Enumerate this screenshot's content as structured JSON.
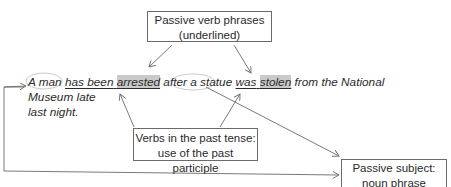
{
  "diagram": {
    "boxes": {
      "top": {
        "line1": "Passive verb phrases",
        "line2": "(underlined)"
      },
      "middle": {
        "line1": "Verbs in the past tense:",
        "line2": "use of the past participle"
      },
      "right": {
        "line1": "Passive subject:",
        "line2": "noun phrase"
      }
    },
    "sentence": {
      "subject1": "A man",
      "verb1_aux": "has been",
      "verb1_participle": "arrested",
      "connector": "after a",
      "subject2": "statue",
      "verb2_aux": "was",
      "verb2_participle": "stolen",
      "rest_line1": "from the National Museum late",
      "line2": "last night."
    },
    "colors": {
      "line": "#6a6a6a",
      "highlight": "#c9c9c9",
      "ellipse": "#bdbdbd"
    }
  }
}
